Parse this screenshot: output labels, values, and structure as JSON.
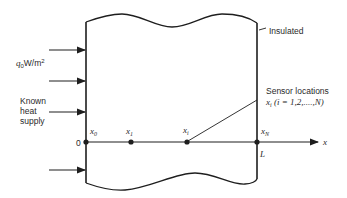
{
  "diagram": {
    "labels": {
      "heat_flux": "q",
      "heat_flux_sub": "0",
      "heat_flux_unit": "W/m",
      "heat_flux_sup": "2",
      "known_1": "Known",
      "known_2": "heat",
      "known_3": "supply",
      "insulated": "Insulated",
      "sensor_title": "Sensor locations",
      "sensor_x": "x",
      "sensor_sub": "i",
      "sensor_range": " (i = 1,2,....,N)",
      "origin": "0",
      "L": "L",
      "axis": "x"
    },
    "points": [
      {
        "name": "x",
        "sub": "0"
      },
      {
        "name": "x",
        "sub": "1"
      },
      {
        "name": "x",
        "sub": "i"
      },
      {
        "name": "x",
        "sub": "N"
      }
    ],
    "arrows_count": 4
  }
}
